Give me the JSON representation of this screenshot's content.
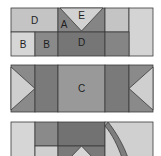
{
  "diagram": {
    "type": "quilt-block-piecing",
    "colors": {
      "lightest": "#dcdcdc",
      "light": "#c4c4c4",
      "medium": "#9a9a9a",
      "medium_dark": "#858585",
      "dark": "#6f6f6f",
      "outline": "#3a3a3a",
      "background": "#ffffff"
    },
    "strips": [
      {
        "id": "strip-1",
        "labels": [
          {
            "text": "D",
            "piece": "top-left rectangle"
          },
          {
            "text": "A",
            "piece": "left side triangle"
          },
          {
            "text": "E",
            "piece": "center inverted triangle"
          },
          {
            "text": "B",
            "piece": "bottom-left square"
          },
          {
            "text": "B",
            "piece": "bottom second square"
          },
          {
            "text": "D",
            "piece": "bottom center rectangle"
          }
        ]
      },
      {
        "id": "strip-2",
        "labels": [
          {
            "text": "C",
            "piece": "center rectangle"
          }
        ]
      },
      {
        "id": "strip-3",
        "labels": []
      }
    ]
  }
}
